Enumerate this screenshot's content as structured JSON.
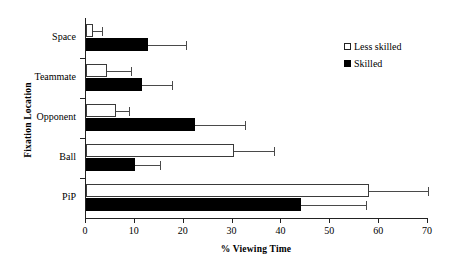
{
  "chart_data": {
    "type": "bar",
    "orientation": "horizontal",
    "title": "",
    "xlabel": "% Viewing Time",
    "ylabel": "Fixation Location",
    "categories": [
      "Space",
      "Teammate",
      "Opponent",
      "Ball",
      "PiP"
    ],
    "xlim": [
      0,
      70
    ],
    "xticks": [
      0,
      10,
      20,
      30,
      40,
      50,
      60,
      70
    ],
    "xticklabels": [
      "0",
      "10",
      "20",
      "30",
      "40",
      "50",
      "60",
      "70"
    ],
    "grid": false,
    "legend_position": "upper right",
    "series": [
      {
        "name": "Less skilled",
        "fill": "#ffffff",
        "edge": "#3a3a3a",
        "values": [
          1.4,
          4.3,
          6.2,
          30.2,
          58.0
        ],
        "errors_upper": [
          3.2,
          9.2,
          8.8,
          38.5,
          70.0
        ]
      },
      {
        "name": "Skilled",
        "fill": "#000000",
        "edge": "#000000",
        "values": [
          12.6,
          11.4,
          22.3,
          10.0,
          44.1
        ],
        "errors_upper": [
          20.5,
          17.7,
          32.6,
          15.2,
          57.4
        ]
      }
    ]
  },
  "legend": {
    "items": [
      {
        "label": "Less skilled",
        "style": "light"
      },
      {
        "label": "Skilled",
        "style": "dark"
      }
    ]
  }
}
